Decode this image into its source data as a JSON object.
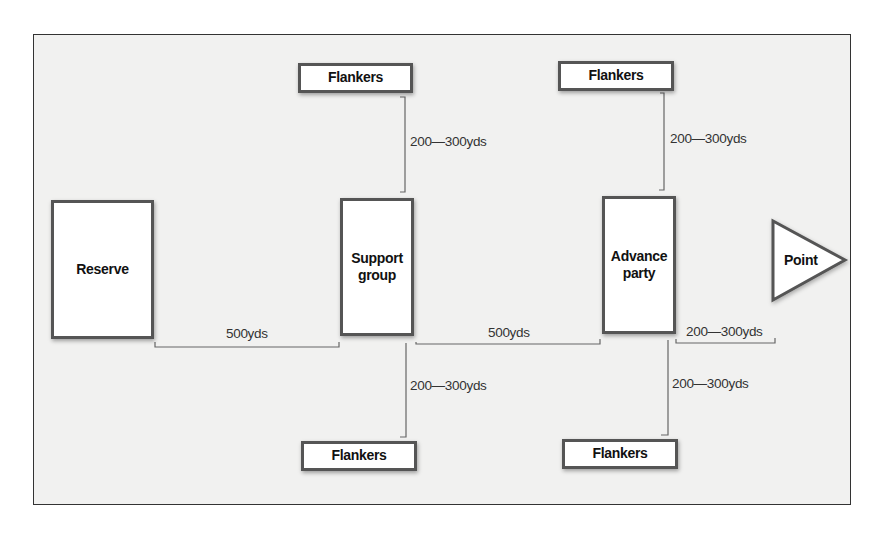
{
  "diagram": {
    "title": "",
    "nodes": {
      "reserve": {
        "label": "Reserve"
      },
      "support_group": {
        "label": "Support group"
      },
      "advance_party": {
        "label": "Advance party"
      },
      "point": {
        "label": "Point"
      },
      "flankers_support_top": {
        "label": "Flankers"
      },
      "flankers_advance_top": {
        "label": "Flankers"
      },
      "flankers_support_bottom": {
        "label": "Flankers"
      },
      "flankers_advance_bottom": {
        "label": "Flankers"
      }
    },
    "distances": {
      "reserve_to_support": "500yds",
      "support_to_advance": "500yds",
      "advance_to_point": "200—300yds",
      "support_to_top_flankers": "200—300yds",
      "advance_to_top_flankers": "200—300yds",
      "support_to_bottom_flankers": "200—300yds",
      "advance_to_bottom_flankers": "200—300yds"
    },
    "colors": {
      "background": "#f1f1f0",
      "box_fill": "#ffffff",
      "box_border": "#555555",
      "line": "#666666",
      "text": "#111111"
    }
  }
}
